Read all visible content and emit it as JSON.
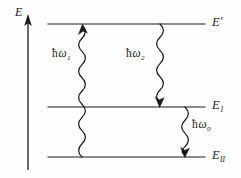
{
  "figure": {
    "type": "energy-level-diagram",
    "background_color": "#fefefe",
    "ink_color": "#1a1a1a",
    "width": 241,
    "height": 178
  },
  "axis": {
    "name": "energy-axis",
    "label": "E",
    "direction": "up",
    "x": 28,
    "y_top": 18,
    "y_bottom": 170,
    "label_x": 17,
    "label_y": 14
  },
  "levels": [
    {
      "id": "upper",
      "label_main": "E",
      "label_sup": "′",
      "label_sub": "",
      "y": 24,
      "x_start": 48,
      "x_end": 205,
      "label_x": 212,
      "label_y": 17
    },
    {
      "id": "middle",
      "label_main": "E",
      "label_sup": "",
      "label_sub": "1",
      "y": 107,
      "x_start": 48,
      "x_end": 205,
      "label_x": 212,
      "label_y": 100
    },
    {
      "id": "lower",
      "label_main": "E",
      "label_sup": "",
      "label_sub": "II",
      "y": 157,
      "x_start": 48,
      "x_end": 205,
      "label_x": 212,
      "label_y": 150
    }
  ],
  "transitions": [
    {
      "id": "absorption-omega1",
      "label_hbar": "ħ",
      "label_omega": "ω",
      "label_sub": "1",
      "from_level": "lower",
      "to_level": "upper",
      "arrow_direction": "up",
      "x": 82,
      "y_start": 157,
      "y_end": 27,
      "label_x": 52,
      "label_y": 54
    },
    {
      "id": "emission-omega2",
      "label_hbar": "ħ",
      "label_omega": "ω",
      "label_sub": "2",
      "from_level": "upper",
      "to_level": "middle",
      "arrow_direction": "down",
      "x": 160,
      "y_start": 25,
      "y_end": 105,
      "label_x": 125,
      "label_y": 54
    },
    {
      "id": "emission-omega0",
      "label_hbar": "ħ",
      "label_omega": "ω",
      "label_sub": "0",
      "from_level": "middle",
      "to_level": "lower",
      "arrow_direction": "down",
      "x": 185,
      "y_start": 109,
      "y_end": 155,
      "label_x": 192,
      "label_y": 124
    }
  ]
}
